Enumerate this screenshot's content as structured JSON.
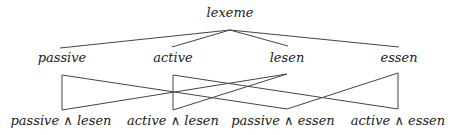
{
  "diagram": {
    "root": {
      "label": "lexeme",
      "x": 230,
      "y": 17,
      "anchor_y": 30
    },
    "middle": [
      {
        "id": "passive",
        "label": "passive",
        "x": 62,
        "y": 62
      },
      {
        "id": "active",
        "label": "active",
        "x": 173,
        "y": 62
      },
      {
        "id": "lesen",
        "label": "lesen",
        "x": 287,
        "y": 62
      },
      {
        "id": "essen",
        "label": "essen",
        "x": 398,
        "y": 62
      }
    ],
    "bottom": [
      {
        "id": "passive_lesen",
        "label": "passive ∧ lesen",
        "x": 62,
        "y": 125
      },
      {
        "id": "active_lesen",
        "label": "active ∧ lesen",
        "x": 173,
        "y": 125
      },
      {
        "id": "passive_essen",
        "label": "passive ∧ essen",
        "x": 287,
        "y": 125
      },
      {
        "id": "active_essen",
        "label": "active ∧ essen",
        "x": 398,
        "y": 125
      }
    ],
    "edges_top": [
      [
        "root",
        "passive"
      ],
      [
        "root",
        "active"
      ],
      [
        "root",
        "lesen"
      ],
      [
        "root",
        "essen"
      ]
    ],
    "edges_bottom": [
      [
        "passive",
        "passive_lesen"
      ],
      [
        "passive",
        "passive_essen"
      ],
      [
        "active",
        "active_lesen"
      ],
      [
        "active",
        "active_essen"
      ],
      [
        "lesen",
        "passive_lesen"
      ],
      [
        "lesen",
        "active_lesen"
      ],
      [
        "essen",
        "passive_essen"
      ],
      [
        "essen",
        "active_essen"
      ]
    ]
  }
}
